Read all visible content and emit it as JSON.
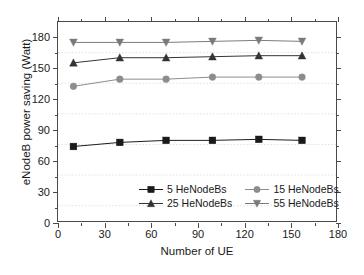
{
  "chart_data": {
    "type": "line",
    "title": "",
    "xlabel": "Number of UE",
    "ylabel": "eNodeB power saving (Watt)",
    "xlim": [
      0,
      180
    ],
    "ylim": [
      0,
      195
    ],
    "xticks": [
      0,
      30,
      60,
      90,
      120,
      150,
      180
    ],
    "yticks": [
      0,
      30,
      60,
      90,
      120,
      150,
      180
    ],
    "xtick_labels": [
      "0",
      "30",
      "60",
      "90",
      "120",
      "150",
      "180"
    ],
    "ytick_labels": [
      "0",
      "30",
      "60",
      "90",
      "120",
      "150",
      "180"
    ],
    "grid": "horizontal-minor-dotted",
    "legend_position": "lower-center-inside",
    "x": [
      10,
      40,
      70,
      100,
      130,
      158
    ],
    "series": [
      {
        "name": "5 HeNodeBs",
        "marker": "square",
        "color": "#1a1a1a",
        "values": [
          73,
          77,
          79,
          79,
          80,
          79
        ]
      },
      {
        "name": "15 HeNodeBs",
        "marker": "circle",
        "color": "#8c8c8c",
        "values": [
          132,
          139,
          139,
          141,
          141,
          141
        ]
      },
      {
        "name": "25 HeNodeBs",
        "marker": "triangle-up",
        "color": "#333333",
        "values": [
          155,
          160,
          160,
          161,
          162,
          162
        ]
      },
      {
        "name": "55 HeNodeBs",
        "marker": "triangle-down",
        "color": "#7a7a7a",
        "values": [
          175,
          175,
          175,
          176,
          177,
          176
        ]
      }
    ]
  },
  "axes": {
    "x_title": "Number of UE",
    "y_title": "eNodeB power saving (Watt)"
  },
  "legend": {
    "items": [
      {
        "label": "5 HeNodeBs",
        "marker": "square",
        "color": "#1a1a1a"
      },
      {
        "label": "15 HeNodeBs",
        "marker": "circle",
        "color": "#8c8c8c"
      },
      {
        "label": "25 HeNodeBs",
        "marker": "triangle-up",
        "color": "#333333"
      },
      {
        "label": "55 HeNodeBs",
        "marker": "triangle-down",
        "color": "#7a7a7a"
      }
    ]
  },
  "style": {
    "frame_color": "#4a4a4a",
    "grid_color": "#e2e2e2",
    "background": "#ffffff"
  }
}
